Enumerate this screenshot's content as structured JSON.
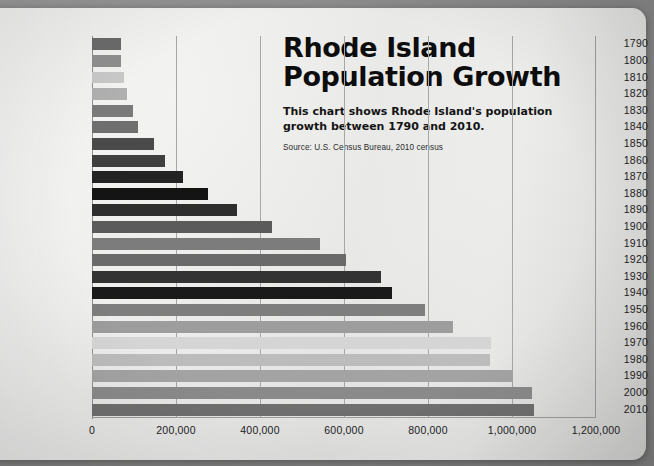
{
  "headline": {
    "title_line1": "Rhode Island",
    "title_line2": "Population Growth",
    "subtitle": "This chart shows Rhode Island's population growth between 1790 and 2010.",
    "source": "Source: U.S. Census Bureau, 2010 census"
  },
  "chart_data": {
    "type": "bar",
    "orientation": "horizontal",
    "title": "Rhode Island Population Growth",
    "subtitle": "This chart shows Rhode Island's population growth between 1790 and 2010.",
    "source": "Source: U.S. Census Bureau, 2010 census",
    "xlabel": "",
    "ylabel": "",
    "xlim": [
      0,
      1200000
    ],
    "xticks": [
      0,
      200000,
      400000,
      600000,
      800000,
      1000000,
      1200000
    ],
    "xtick_labels": [
      "0",
      "200,000",
      "400,000",
      "600,000",
      "800,000",
      "1,000,000",
      "1,200,000"
    ],
    "grid": true,
    "legend": false,
    "categories": [
      "1790",
      "1800",
      "1810",
      "1820",
      "1830",
      "1840",
      "1850",
      "1860",
      "1870",
      "1880",
      "1890",
      "1900",
      "1910",
      "1920",
      "1930",
      "1940",
      "1950",
      "1960",
      "1970",
      "1980",
      "1990",
      "2000",
      "2010"
    ],
    "values": [
      68825,
      69122,
      76931,
      83059,
      97199,
      108830,
      147545,
      174620,
      217353,
      276531,
      345506,
      428556,
      542610,
      604397,
      687497,
      713346,
      791896,
      859488,
      949723,
      947154,
      1003464,
      1048319,
      1052567
    ],
    "bar_colors": [
      "#6b6b6b",
      "#8f8f8f",
      "#c9c9c9",
      "#b0b0b0",
      "#7a7a7a",
      "#6f6f6f",
      "#4a4a4a",
      "#3f3f3f",
      "#232323",
      "#141414",
      "#2e2e2e",
      "#5b5b5b",
      "#7c7c7c",
      "#6a6a6a",
      "#333333",
      "#1a1a1a",
      "#7e7e7e",
      "#9d9d9d",
      "#d5d5d5",
      "#bcbcbc",
      "#a3a3a3",
      "#8a8a8a",
      "#6f6f6f"
    ]
  },
  "colors": {
    "paper": "#ececeb",
    "surface": "#8d8d8d",
    "axis": "#9b9b9b",
    "text": "#1d1d1d"
  }
}
